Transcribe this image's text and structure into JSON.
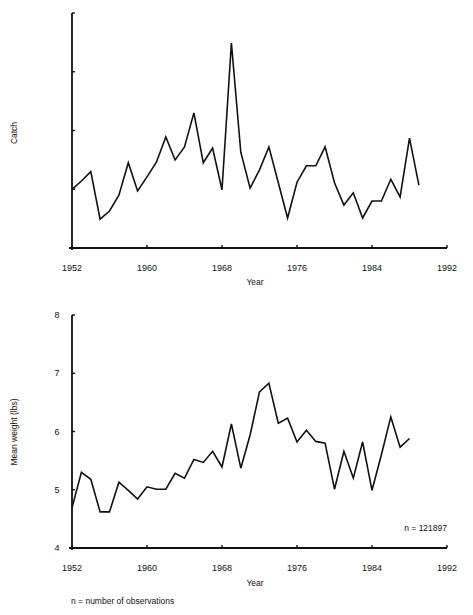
{
  "figure": {
    "footnote": "n = number of observations"
  },
  "chart_data": [
    {
      "type": "line",
      "title": "",
      "xlabel": "Year",
      "ylabel": "Catch",
      "xlim": [
        1952,
        1992
      ],
      "xticks": [
        1952,
        1960,
        1968,
        1976,
        1984,
        1992
      ],
      "ylim": [
        0,
        4
      ],
      "yticks": [
        1,
        2,
        3,
        4
      ],
      "ytick_labels_shown": false,
      "grid": false,
      "note": "y-axis unlabeled (relative units, tick spacing = 1)",
      "x": [
        1952,
        1953,
        1954,
        1955,
        1956,
        1957,
        1958,
        1959,
        1960,
        1961,
        1962,
        1963,
        1964,
        1965,
        1966,
        1967,
        1968,
        1969,
        1970,
        1971,
        1972,
        1973,
        1974,
        1975,
        1976,
        1977,
        1978,
        1979,
        1980,
        1981,
        1982,
        1983,
        1984,
        1985,
        1986,
        1987,
        1988,
        1989
      ],
      "series": [
        {
          "name": "Catch",
          "values": [
            1.0,
            1.14,
            1.3,
            0.49,
            0.63,
            0.9,
            1.45,
            0.97,
            1.21,
            1.46,
            1.89,
            1.5,
            1.72,
            2.3,
            1.45,
            1.7,
            0.99,
            3.49,
            1.63,
            1.02,
            1.33,
            1.72,
            1.11,
            0.51,
            1.12,
            1.4,
            1.4,
            1.72,
            1.11,
            0.73,
            0.94,
            0.51,
            0.8,
            0.8,
            1.17,
            0.87,
            1.87,
            1.07
          ]
        }
      ],
      "annotation": ""
    },
    {
      "type": "line",
      "title": "",
      "xlabel": "Year",
      "ylabel": "Mean weight (lbs)",
      "xlim": [
        1952,
        1992
      ],
      "xticks": [
        1952,
        1960,
        1968,
        1976,
        1984,
        1992
      ],
      "ylim": [
        4,
        8
      ],
      "yticks": [
        4,
        5,
        6,
        7,
        8
      ],
      "ytick_labels_shown": true,
      "grid": false,
      "x": [
        1952,
        1953,
        1954,
        1955,
        1956,
        1957,
        1958,
        1959,
        1960,
        1961,
        1962,
        1963,
        1964,
        1965,
        1966,
        1967,
        1968,
        1969,
        1970,
        1971,
        1972,
        1973,
        1974,
        1975,
        1976,
        1977,
        1978,
        1979,
        1980,
        1981,
        1982,
        1983,
        1984,
        1985,
        1986,
        1987,
        1988
      ],
      "series": [
        {
          "name": "Mean weight",
          "values": [
            4.69,
            5.3,
            5.18,
            4.62,
            4.62,
            5.13,
            4.99,
            4.84,
            5.05,
            5.01,
            5.01,
            5.28,
            5.2,
            5.52,
            5.47,
            5.66,
            5.39,
            6.13,
            5.37,
            5.94,
            6.68,
            6.83,
            6.14,
            6.23,
            5.82,
            6.02,
            5.83,
            5.8,
            5.01,
            5.66,
            5.2,
            5.82,
            4.99,
            5.6,
            6.25,
            5.73,
            5.88
          ]
        }
      ],
      "annotation": "n = 121897"
    }
  ]
}
